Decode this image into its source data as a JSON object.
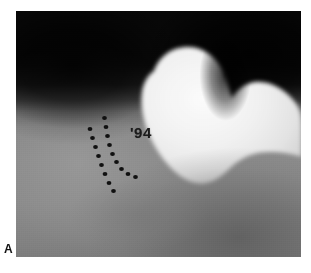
{
  "figure": {
    "panel_label": "A",
    "modality": "radiograph",
    "view": "hip-lateral",
    "background_color": "#ffffff"
  },
  "radiograph": {
    "name": "hip-radiograph",
    "frame": {
      "x": 16,
      "y": 11,
      "width": 285,
      "height": 246
    },
    "tones": {
      "film_dark": "#0a0a0a",
      "film_midgray": "#8a8a8a",
      "bone_bright": "#ededed",
      "bone_highlight": "#f6f6f6",
      "soft_tissue_shadow": "#2a2a2a"
    },
    "annotations": {
      "date_text": "'94",
      "date_color": "#1b1b1b",
      "dotted_line_color": "#101010",
      "dotted_line_count": 2
    },
    "structures": [
      {
        "name": "femoral-head",
        "label": "femoral head"
      },
      {
        "name": "femoral-neck",
        "label": "femoral neck"
      },
      {
        "name": "greater-trochanter",
        "label": "greater trochanter"
      },
      {
        "name": "acetabulum",
        "label": "acetabulum"
      },
      {
        "name": "ischium",
        "label": "ischium"
      }
    ]
  }
}
